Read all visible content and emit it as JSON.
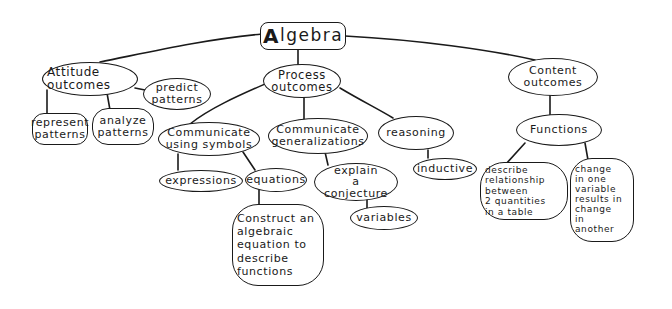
{
  "concept_map": {
    "title": "Algebra",
    "root": {
      "first_letter": "A",
      "rest": "lgebra"
    },
    "nodes": {
      "attitude": "Attitude\noutcomes",
      "predict": "predict\npatterns",
      "represent": "represent\npatterns",
      "analyze": "analyze\npatterns",
      "process": "Process\noutcomes",
      "comm_symbols": "Communicate\nusing symbols",
      "comm_general": "Communicate\ngeneralizations",
      "reasoning": "reasoning",
      "expressions": "expressions",
      "equations": "equations",
      "construct": "Construct an\nalgebraic\nequation to\ndescribe\nfunctions",
      "explain": "explain\na conjecture",
      "variables": "variables",
      "inductive": "inductive",
      "content": "Content\noutcomes",
      "functions": "Functions",
      "describe": "describe\nrelationship\nbetween\n2 quantities\nin a table",
      "change": "change\nin one\nvariable\nresults in\nchange\nin\nanother"
    },
    "edges": [
      [
        "Algebra",
        "Attitude outcomes"
      ],
      [
        "Algebra",
        "Process outcomes"
      ],
      [
        "Algebra",
        "Content outcomes"
      ],
      [
        "Attitude outcomes",
        "predict patterns"
      ],
      [
        "Attitude outcomes",
        "represent patterns"
      ],
      [
        "Attitude outcomes",
        "analyze patterns"
      ],
      [
        "Process outcomes",
        "Communicate using symbols"
      ],
      [
        "Process outcomes",
        "Communicate generalizations"
      ],
      [
        "Process outcomes",
        "reasoning"
      ],
      [
        "Communicate using symbols",
        "expressions"
      ],
      [
        "Communicate using symbols",
        "equations"
      ],
      [
        "equations",
        "Construct an algebraic equation to describe functions"
      ],
      [
        "Communicate generalizations",
        "explain a conjecture"
      ],
      [
        "explain a conjecture",
        "variables"
      ],
      [
        "reasoning",
        "inductive"
      ],
      [
        "Content outcomes",
        "Functions"
      ],
      [
        "Functions",
        "describe relationship between 2 quantities in a table"
      ],
      [
        "Functions",
        "change in one variable results in change in another"
      ]
    ]
  }
}
